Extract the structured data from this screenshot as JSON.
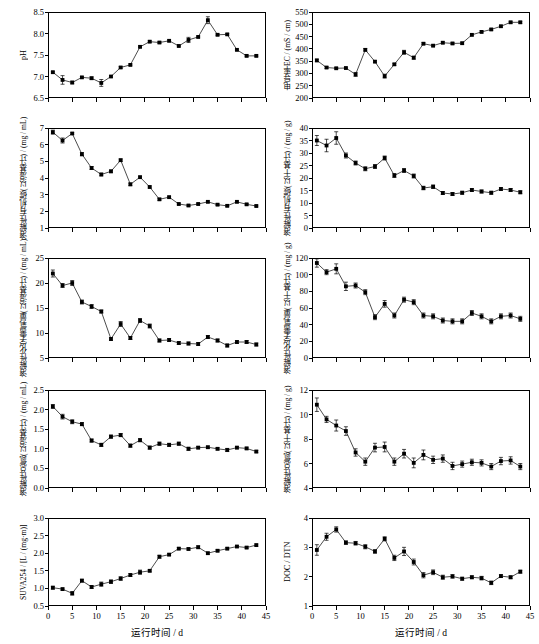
{
  "figure": {
    "xlabel": "运行时间 / d",
    "xlim": [
      0,
      45
    ],
    "xticks": [
      0,
      5,
      10,
      15,
      20,
      25,
      30,
      35,
      40,
      45
    ],
    "x": [
      1,
      3,
      5,
      7,
      9,
      11,
      13,
      15,
      17,
      19,
      21,
      23,
      25,
      27,
      29,
      31,
      33,
      35,
      37,
      39,
      41,
      43
    ]
  },
  "chart_data": [
    {
      "type": "line",
      "panel": "a",
      "title": "",
      "ylabel": "pH",
      "ylabel_rotated": true,
      "xlabel": "运行时间 / d",
      "xlim": [
        0,
        45
      ],
      "ylim": [
        6.5,
        8.5
      ],
      "yticks": [
        6.5,
        7.0,
        7.5,
        8.0,
        8.5
      ],
      "xticks": [
        0,
        5,
        10,
        15,
        20,
        25,
        30,
        35,
        40,
        45
      ],
      "grid": false,
      "legend": null,
      "x": [
        1,
        3,
        5,
        7,
        9,
        11,
        13,
        15,
        17,
        19,
        21,
        23,
        25,
        27,
        29,
        31,
        33,
        35,
        37,
        39,
        41,
        43
      ],
      "values": [
        7.1,
        6.92,
        6.86,
        6.98,
        6.96,
        6.85,
        7.0,
        7.21,
        7.27,
        7.69,
        7.81,
        7.79,
        7.83,
        7.71,
        7.85,
        7.92,
        8.31,
        7.97,
        7.98,
        7.62,
        7.48,
        7.48
      ],
      "errors": [
        0.02,
        0.1,
        0.03,
        0.02,
        0.03,
        0.08,
        0.02,
        0.02,
        0.02,
        0.02,
        0.02,
        0.02,
        0.02,
        0.02,
        0.06,
        0.02,
        0.08,
        0.02,
        0.02,
        0.02,
        0.02,
        0.02
      ]
    },
    {
      "type": "line",
      "panel": "b",
      "title": "",
      "ylabel": "电导率EC / (mS / cm)",
      "ylabel_rotated": true,
      "xlabel": "运行时间 / d",
      "xlim": [
        0,
        45
      ],
      "ylim": [
        200,
        550
      ],
      "yticks": [
        200,
        250,
        300,
        350,
        400,
        450,
        500,
        550
      ],
      "xticks": [
        0,
        5,
        10,
        15,
        20,
        25,
        30,
        35,
        40,
        45
      ],
      "grid": false,
      "legend": null,
      "x": [
        1,
        3,
        5,
        7,
        9,
        11,
        13,
        15,
        17,
        19,
        21,
        23,
        25,
        27,
        29,
        31,
        33,
        35,
        37,
        39,
        41,
        43
      ],
      "values": [
        353,
        324,
        321,
        322,
        296,
        396,
        348,
        289,
        337,
        386,
        364,
        421,
        413,
        425,
        422,
        423,
        457,
        469,
        479,
        492,
        508,
        508
      ],
      "errors": [
        5,
        4,
        3,
        3,
        8,
        5,
        4,
        8,
        4,
        8,
        6,
        4,
        4,
        4,
        4,
        4,
        4,
        4,
        4,
        4,
        4,
        4
      ]
    },
    {
      "type": "line",
      "panel": "c",
      "title": "",
      "ylabel": "溶解性有机碳(以湿基计) / (mg / mL)",
      "ylabel_rotated": true,
      "xlabel": "运行时间 / d",
      "xlim": [
        0,
        45
      ],
      "ylim": [
        1,
        7
      ],
      "yticks": [
        1,
        2,
        3,
        4,
        5,
        6,
        7
      ],
      "xticks": [
        0,
        5,
        10,
        15,
        20,
        25,
        30,
        35,
        40,
        45
      ],
      "grid": false,
      "legend": null,
      "x": [
        1,
        3,
        5,
        7,
        9,
        11,
        13,
        15,
        17,
        19,
        21,
        23,
        25,
        27,
        29,
        31,
        33,
        35,
        37,
        39,
        41,
        43
      ],
      "values": [
        6.75,
        6.25,
        6.67,
        5.43,
        4.6,
        4.21,
        4.4,
        5.07,
        3.62,
        4.05,
        3.46,
        2.72,
        2.85,
        2.44,
        2.35,
        2.44,
        2.57,
        2.4,
        2.33,
        2.57,
        2.42,
        2.32
      ],
      "errors": [
        0.12,
        0.15,
        0.05,
        0.1,
        0.09,
        0.08,
        0.08,
        0.07,
        0.08,
        0.06,
        0.06,
        0.06,
        0.06,
        0.05,
        0.05,
        0.05,
        0.05,
        0.05,
        0.05,
        0.05,
        0.05,
        0.05
      ]
    },
    {
      "type": "line",
      "panel": "d",
      "title": "",
      "ylabel": "溶解性有机碳(以干基计) / (mg / g)",
      "ylabel_rotated": true,
      "xlabel": "运行时间 / d",
      "xlim": [
        0,
        45
      ],
      "ylim": [
        0,
        40
      ],
      "yticks": [
        0,
        5,
        10,
        15,
        20,
        25,
        30,
        35,
        40
      ],
      "xticks": [
        0,
        5,
        10,
        15,
        20,
        25,
        30,
        35,
        40,
        45
      ],
      "grid": false,
      "legend": null,
      "x": [
        1,
        3,
        5,
        7,
        9,
        11,
        13,
        15,
        17,
        19,
        21,
        23,
        25,
        27,
        29,
        31,
        33,
        35,
        37,
        39,
        41,
        43
      ],
      "values": [
        35.0,
        33.0,
        36.0,
        29.0,
        26.0,
        23.7,
        24.6,
        28.0,
        21.0,
        23.0,
        20.8,
        16.0,
        16.5,
        14.0,
        13.6,
        14.1,
        15.2,
        14.6,
        14.1,
        15.6,
        15.2,
        14.3
      ],
      "errors": [
        2.0,
        2.5,
        2.5,
        1.0,
        0.8,
        0.8,
        0.8,
        0.8,
        0.8,
        0.8,
        0.8,
        0.7,
        0.7,
        0.6,
        0.6,
        0.6,
        0.6,
        0.6,
        0.6,
        0.6,
        0.6,
        0.6
      ]
    },
    {
      "type": "line",
      "panel": "e",
      "title": "",
      "ylabel": "溶解性化学需氧量(以湿基计) / (mg / mL)",
      "ylabel_rotated": true,
      "xlabel": "运行时间 / d",
      "xlim": [
        0,
        45
      ],
      "ylim": [
        5,
        25
      ],
      "yticks": [
        5,
        10,
        15,
        20,
        25
      ],
      "xticks": [
        0,
        5,
        10,
        15,
        20,
        25,
        30,
        35,
        40,
        45
      ],
      "grid": false,
      "legend": null,
      "x": [
        1,
        3,
        5,
        7,
        9,
        11,
        13,
        15,
        17,
        19,
        21,
        23,
        25,
        27,
        29,
        31,
        33,
        35,
        37,
        39,
        41,
        43
      ],
      "values": [
        21.9,
        19.5,
        20.0,
        16.2,
        15.3,
        14.3,
        8.8,
        11.8,
        9.0,
        12.5,
        11.4,
        8.5,
        8.6,
        8.0,
        7.9,
        7.8,
        9.2,
        8.5,
        7.5,
        8.2,
        8.2,
        7.7
      ],
      "errors": [
        0.7,
        0.4,
        0.5,
        0.4,
        0.4,
        0.3,
        0.3,
        0.5,
        0.3,
        0.4,
        0.4,
        0.3,
        0.3,
        0.3,
        0.3,
        0.3,
        0.3,
        0.3,
        0.3,
        0.3,
        0.3,
        0.3
      ]
    },
    {
      "type": "line",
      "panel": "f",
      "title": "",
      "ylabel": "溶解性化学需氧量(以干基计) / (mg / g)",
      "ylabel_rotated": true,
      "xlabel": "运行时间 / d",
      "xlim": [
        0,
        45
      ],
      "ylim": [
        0,
        120
      ],
      "yticks": [
        0,
        20,
        40,
        60,
        80,
        100,
        120
      ],
      "xticks": [
        0,
        5,
        10,
        15,
        20,
        25,
        30,
        35,
        40,
        45
      ],
      "grid": false,
      "legend": null,
      "x": [
        1,
        3,
        5,
        7,
        9,
        11,
        13,
        15,
        17,
        19,
        21,
        23,
        25,
        27,
        29,
        31,
        33,
        35,
        37,
        39,
        41,
        43
      ],
      "values": [
        114,
        103,
        107,
        86,
        87,
        79,
        49,
        65,
        51,
        70,
        67,
        51,
        50,
        45,
        44,
        44,
        54,
        50,
        44,
        50,
        51,
        47
      ],
      "errors": [
        5,
        3,
        6,
        5,
        3,
        3,
        3,
        4,
        3,
        3,
        3,
        3,
        3,
        3,
        3,
        3,
        3,
        3,
        3,
        3,
        3,
        3
      ]
    },
    {
      "type": "line",
      "panel": "g",
      "title": "",
      "ylabel": "溶解性总氮(以湿基计) / (mg / mL)",
      "ylabel_rotated": true,
      "xlabel": "运行时间 / d",
      "xlim": [
        0,
        45
      ],
      "ylim": [
        0.0,
        2.5
      ],
      "yticks": [
        0.0,
        0.5,
        1.0,
        1.5,
        2.0,
        2.5
      ],
      "xticks": [
        0,
        5,
        10,
        15,
        20,
        25,
        30,
        35,
        40,
        45
      ],
      "grid": false,
      "legend": null,
      "x": [
        1,
        3,
        5,
        7,
        9,
        11,
        13,
        15,
        17,
        19,
        21,
        23,
        25,
        27,
        29,
        31,
        33,
        35,
        37,
        39,
        41,
        43
      ],
      "values": [
        2.08,
        1.82,
        1.69,
        1.63,
        1.21,
        1.1,
        1.31,
        1.35,
        1.08,
        1.22,
        1.03,
        1.13,
        1.1,
        1.13,
        1.0,
        1.03,
        1.04,
        1.0,
        0.97,
        1.03,
        1.01,
        0.93
      ],
      "errors": [
        0.05,
        0.06,
        0.05,
        0.04,
        0.04,
        0.04,
        0.04,
        0.04,
        0.04,
        0.04,
        0.04,
        0.04,
        0.04,
        0.04,
        0.04,
        0.03,
        0.03,
        0.03,
        0.04,
        0.03,
        0.03,
        0.03
      ]
    },
    {
      "type": "line",
      "panel": "h",
      "title": "",
      "ylabel": "溶解性总氮(以干基计) / (mg / g)",
      "ylabel_rotated": true,
      "xlabel": "运行时间 / d",
      "xlim": [
        0,
        45
      ],
      "ylim": [
        4,
        12
      ],
      "yticks": [
        4,
        6,
        8,
        10,
        12
      ],
      "xticks": [
        0,
        5,
        10,
        15,
        20,
        25,
        30,
        35,
        40,
        45
      ],
      "grid": false,
      "legend": null,
      "x": [
        1,
        3,
        5,
        7,
        9,
        11,
        13,
        15,
        17,
        19,
        21,
        23,
        25,
        27,
        29,
        31,
        33,
        35,
        37,
        39,
        41,
        43
      ],
      "values": [
        10.8,
        9.6,
        9.1,
        8.65,
        6.9,
        6.15,
        7.3,
        7.35,
        6.15,
        6.8,
        6.05,
        6.7,
        6.3,
        6.4,
        5.8,
        5.95,
        6.1,
        6.05,
        5.75,
        6.2,
        6.25,
        5.75
      ],
      "errors": [
        0.55,
        0.25,
        0.45,
        0.35,
        0.3,
        0.3,
        0.35,
        0.4,
        0.3,
        0.35,
        0.4,
        0.4,
        0.3,
        0.3,
        0.3,
        0.25,
        0.25,
        0.25,
        0.25,
        0.3,
        0.3,
        0.25
      ]
    },
    {
      "type": "line",
      "panel": "i",
      "title": "",
      "ylabel": "SUVA254 / [L / (mg·m)]",
      "ylabel_rotated": true,
      "xlabel": "运行时间 / d",
      "xlim": [
        0,
        45
      ],
      "ylim": [
        0.5,
        3.0
      ],
      "yticks": [
        0.5,
        1.0,
        1.5,
        2.0,
        2.5,
        3.0
      ],
      "xticks": [
        0,
        5,
        10,
        15,
        20,
        25,
        30,
        35,
        40,
        45
      ],
      "grid": false,
      "legend": null,
      "x": [
        1,
        3,
        5,
        7,
        9,
        11,
        13,
        15,
        17,
        19,
        21,
        23,
        25,
        27,
        29,
        31,
        33,
        35,
        37,
        39,
        41,
        43
      ],
      "values": [
        1.02,
        0.98,
        0.86,
        1.22,
        1.04,
        1.12,
        1.19,
        1.28,
        1.38,
        1.46,
        1.5,
        1.9,
        1.96,
        2.13,
        2.12,
        2.17,
        2.0,
        2.07,
        2.13,
        2.19,
        2.16,
        2.23
      ],
      "errors": [
        0.04,
        0.03,
        0.05,
        0.04,
        0.04,
        0.06,
        0.05,
        0.05,
        0.04,
        0.06,
        0.03,
        0.04,
        0.03,
        0.03,
        0.03,
        0.04,
        0.03,
        0.03,
        0.03,
        0.03,
        0.03,
        0.03
      ]
    },
    {
      "type": "line",
      "panel": "j",
      "title": "",
      "ylabel": "DOC / DTN",
      "ylabel_rotated": true,
      "xlabel": "运行时间 / d",
      "xlim": [
        0,
        45
      ],
      "ylim": [
        1,
        4
      ],
      "yticks": [
        1,
        2,
        3,
        4
      ],
      "xticks": [
        0,
        5,
        10,
        15,
        20,
        25,
        30,
        35,
        40,
        45
      ],
      "grid": false,
      "legend": null,
      "x": [
        1,
        3,
        5,
        7,
        9,
        11,
        13,
        15,
        17,
        19,
        21,
        23,
        25,
        27,
        29,
        31,
        33,
        35,
        37,
        39,
        41,
        43
      ],
      "values": [
        2.91,
        3.36,
        3.61,
        3.16,
        3.14,
        3.02,
        2.86,
        3.29,
        2.64,
        2.86,
        2.5,
        2.05,
        2.15,
        1.98,
        2.01,
        1.93,
        1.98,
        1.95,
        1.79,
        2.02,
        1.98,
        2.17
      ],
      "errors": [
        0.18,
        0.12,
        0.09,
        0.06,
        0.06,
        0.07,
        0.06,
        0.07,
        0.09,
        0.14,
        0.1,
        0.09,
        0.08,
        0.07,
        0.06,
        0.05,
        0.05,
        0.06,
        0.06,
        0.05,
        0.05,
        0.05
      ]
    }
  ],
  "panels_layout": [
    {
      "id": "a",
      "col": 0,
      "row": 0
    },
    {
      "id": "b",
      "col": 1,
      "row": 0
    },
    {
      "id": "c",
      "col": 0,
      "row": 1
    },
    {
      "id": "d",
      "col": 1,
      "row": 1
    },
    {
      "id": "e",
      "col": 0,
      "row": 2
    },
    {
      "id": "f",
      "col": 1,
      "row": 2
    },
    {
      "id": "g",
      "col": 0,
      "row": 3
    },
    {
      "id": "h",
      "col": 1,
      "row": 3
    },
    {
      "id": "i",
      "col": 0,
      "row": 4
    },
    {
      "id": "j",
      "col": 1,
      "row": 4
    }
  ]
}
